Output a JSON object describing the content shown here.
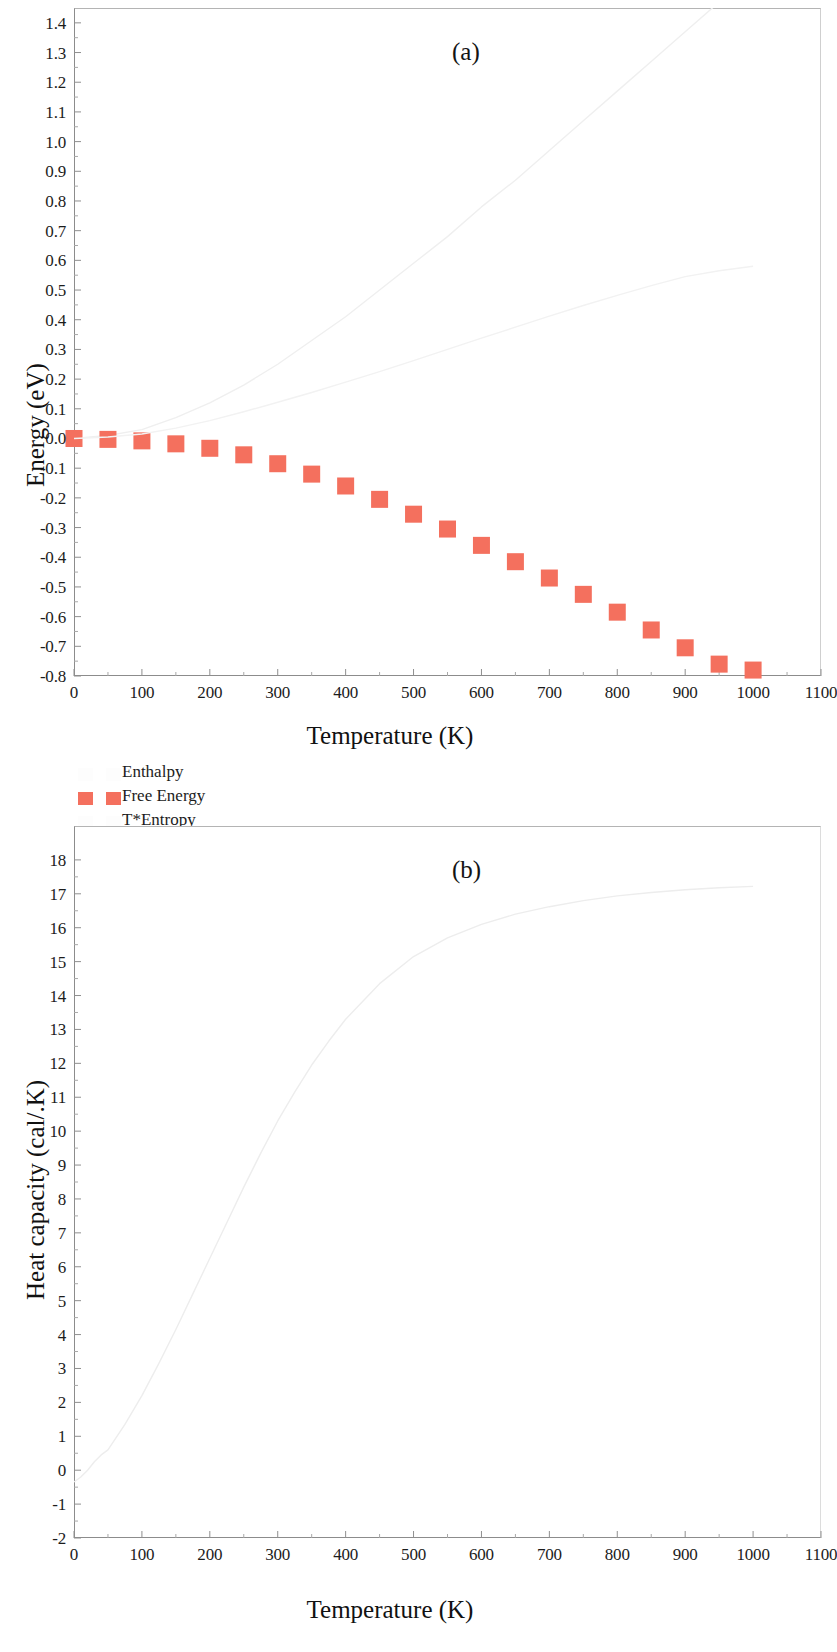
{
  "figure": {
    "panels": [
      "(a)",
      "(b)"
    ]
  },
  "panel_a": {
    "letter": "(a)",
    "ylabel": "Energy (eV)",
    "xlabel": "Temperature (K)",
    "yticks": [
      "1.4",
      "1.3",
      "1.2",
      "1.1",
      "1.0",
      "0.9",
      "0.8",
      "0.7",
      "0.6",
      "0.5",
      "0.4",
      "0.3",
      "0.2",
      "0.1",
      "0.0",
      "-0.1",
      "-0.2",
      "-0.3",
      "-0.4",
      "-0.5",
      "-0.6",
      "-0.7",
      "-0.8"
    ],
    "xticks": [
      "0",
      "100",
      "200",
      "300",
      "400",
      "500",
      "600",
      "700",
      "800",
      "900",
      "1000",
      "1100"
    ],
    "legend": [
      {
        "label": "Enthalpy",
        "swatch": "faint"
      },
      {
        "label": "Free Energy",
        "swatch": "red"
      },
      {
        "label": "T*Entropy",
        "swatch": "faint"
      }
    ]
  },
  "panel_b": {
    "letter": "(b)",
    "ylabel": "Heat capacity (cal/.K)",
    "xlabel": "Temperature (K)",
    "yticks": [
      "18",
      "17",
      "16",
      "15",
      "14",
      "13",
      "12",
      "11",
      "10",
      "9",
      "8",
      "7",
      "6",
      "5",
      "4",
      "3",
      "2",
      "1",
      "0",
      "-1",
      "-2"
    ],
    "xticks": [
      "0",
      "100",
      "200",
      "300",
      "400",
      "500",
      "600",
      "700",
      "800",
      "900",
      "1000",
      "1100"
    ]
  },
  "colors": {
    "free_energy_marker": "#f4705e",
    "faint_line": "#eeeeee",
    "axis": "#8c8c8c",
    "text": "#1a1a1a"
  },
  "chart_data": [
    {
      "type": "line",
      "id": "panel-a",
      "title": "(a)",
      "xlabel": "Temperature (K)",
      "ylabel": "Energy (eV)",
      "xlim": [
        0,
        1100
      ],
      "ylim": [
        -0.8,
        1.45
      ],
      "xticks": [
        0,
        100,
        200,
        300,
        400,
        500,
        600,
        700,
        800,
        900,
        1000,
        1100
      ],
      "yticks": [
        1.4,
        1.3,
        1.2,
        1.1,
        1.0,
        0.9,
        0.8,
        0.7,
        0.6,
        0.5,
        0.4,
        0.3,
        0.2,
        0.1,
        0.0,
        -0.1,
        -0.2,
        -0.3,
        -0.4,
        -0.5,
        -0.6,
        -0.7,
        -0.8
      ],
      "grid": false,
      "legend_position": "below-left",
      "x": [
        0,
        50,
        100,
        150,
        200,
        250,
        300,
        350,
        400,
        450,
        500,
        550,
        600,
        650,
        700,
        750,
        800,
        850,
        900,
        950,
        1000
      ],
      "series": [
        {
          "name": "Enthalpy",
          "style": "faint-line",
          "color": "#efefef",
          "values": [
            0.0,
            0.01,
            0.03,
            0.07,
            0.12,
            0.18,
            0.25,
            0.33,
            0.41,
            0.5,
            0.59,
            0.68,
            0.78,
            0.87,
            0.97,
            1.07,
            1.17,
            1.27,
            1.37,
            1.47,
            1.57
          ]
        },
        {
          "name": "Free Energy",
          "style": "square-markers",
          "color": "#f4705e",
          "values": [
            0.0,
            -0.003,
            -0.008,
            -0.018,
            -0.033,
            -0.055,
            -0.085,
            -0.12,
            -0.16,
            -0.205,
            -0.255,
            -0.305,
            -0.36,
            -0.415,
            -0.47,
            -0.525,
            -0.585,
            -0.645,
            -0.705,
            -0.76,
            -0.78
          ]
        },
        {
          "name": "T*Entropy",
          "style": "faint-line",
          "color": "#f2f2f2",
          "values": [
            0.0,
            0.005,
            0.015,
            0.035,
            0.06,
            0.09,
            0.122,
            0.155,
            0.19,
            0.225,
            0.262,
            0.3,
            0.338,
            0.375,
            0.412,
            0.448,
            0.482,
            0.515,
            0.545,
            0.565,
            0.58
          ]
        }
      ]
    },
    {
      "type": "line",
      "id": "panel-b",
      "title": "(b)",
      "xlabel": "Temperature (K)",
      "ylabel": "Heat capacity (cal/.K)",
      "xlim": [
        0,
        1100
      ],
      "ylim": [
        -2,
        19
      ],
      "xticks": [
        0,
        100,
        200,
        300,
        400,
        500,
        600,
        700,
        800,
        900,
        1000,
        1100
      ],
      "yticks": [
        18,
        17,
        16,
        15,
        14,
        13,
        12,
        11,
        10,
        9,
        8,
        7,
        6,
        5,
        4,
        3,
        2,
        1,
        0,
        -1,
        -2
      ],
      "grid": false,
      "legend_position": "none",
      "x": [
        0,
        10,
        20,
        30,
        40,
        50,
        75,
        100,
        125,
        150,
        175,
        200,
        225,
        250,
        275,
        300,
        325,
        350,
        375,
        400,
        450,
        500,
        550,
        600,
        650,
        700,
        750,
        800,
        850,
        900,
        950,
        1000
      ],
      "series": [
        {
          "name": "Heat capacity",
          "style": "faint-line",
          "color": "#ededed",
          "values": [
            -0.35,
            -0.2,
            0.0,
            0.25,
            0.45,
            0.6,
            1.35,
            2.2,
            3.15,
            4.15,
            5.2,
            6.25,
            7.3,
            8.35,
            9.35,
            10.3,
            11.15,
            11.95,
            12.65,
            13.3,
            14.35,
            15.15,
            15.7,
            16.1,
            16.4,
            16.62,
            16.8,
            16.94,
            17.04,
            17.12,
            17.18,
            17.22
          ]
        }
      ]
    }
  ]
}
